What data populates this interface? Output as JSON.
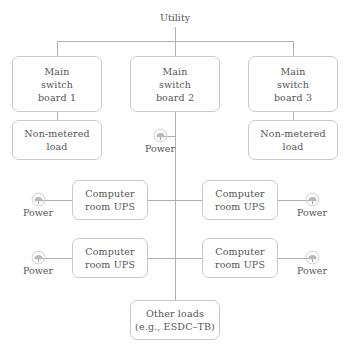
{
  "diagram": {
    "line_color": "#b0b0b0",
    "box_border_color": "#c9c9c9",
    "text_color": "#555555",
    "background": "#ffffff"
  },
  "source": {
    "label": "Utility"
  },
  "switchboards": [
    {
      "line1": "Main",
      "line2": "switch",
      "line3": "board 1"
    },
    {
      "line1": "Main",
      "line2": "switch",
      "line3": "board 2"
    },
    {
      "line1": "Main",
      "line2": "switch",
      "line3": "board 3"
    }
  ],
  "non_metered_loads": [
    {
      "line1": "Non-metered",
      "line2": "load"
    },
    {
      "line1": "Non-metered",
      "line2": "load"
    }
  ],
  "ups_units": [
    {
      "line1": "Computer",
      "line2": "room UPS"
    },
    {
      "line1": "Computer",
      "line2": "room UPS"
    },
    {
      "line1": "Computer",
      "line2": "room UPS"
    },
    {
      "line1": "Computer",
      "line2": "room UPS"
    }
  ],
  "other_loads": {
    "line1": "Other loads",
    "line2": "(e.g., ESDC–TB)"
  },
  "meters": [
    {
      "label": "Power",
      "icon": "power-meter-icon",
      "position": "center-top"
    },
    {
      "label": "Power",
      "icon": "power-meter-icon",
      "position": "left-upper-ups"
    },
    {
      "label": "Power",
      "icon": "power-meter-icon",
      "position": "right-upper-ups"
    },
    {
      "label": "Power",
      "icon": "power-meter-icon",
      "position": "left-lower-ups"
    },
    {
      "label": "Power",
      "icon": "power-meter-icon",
      "position": "right-lower-ups"
    }
  ]
}
